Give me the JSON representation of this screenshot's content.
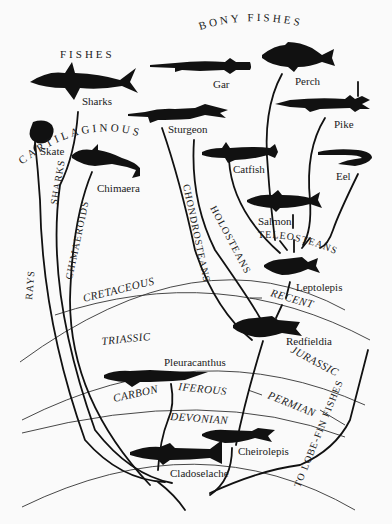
{
  "headings": {
    "cartilaginous": "CARTILAGINOUS",
    "cartilaginous_2": "FISHES",
    "bony": "BONY   FISHES"
  },
  "fishes": {
    "sharks": "Sharks",
    "gar": "Gar",
    "perch": "Perch",
    "pike": "Pike",
    "sturgeon": "Sturgeon",
    "skate": "Skate",
    "chimaera": "Chimaera",
    "catfish": "Catfish",
    "eel": "Eel",
    "salmon": "Salmon",
    "leptolepis": "Leptolepis",
    "redfieldia": "Redfieldia",
    "pleuracanthus": "Pleuracanthus",
    "cheirolepis": "Cheirolepis",
    "cladoselache": "Cladoselache"
  },
  "groups": {
    "rays": "RAYS",
    "sharks": "SHARKS",
    "chimaeroids": "CHIMAEROIDS",
    "chondrosteans": "CHONDROSTEANS",
    "holosteans": "HOLOSTEANS",
    "teleosteans": "TELEOSTEANS",
    "lobe_fin": "TO LOBE-FIN FISHES"
  },
  "periods": {
    "cretaceous": "CRETACEOUS",
    "recent": "RECENT",
    "triassic": "TRIASSIC",
    "jurassic": "JURASSIC",
    "carbon": "CARBON",
    "iferous": "IFEROUS",
    "permian": "PERMIAN",
    "devonian": "DEVONIAN"
  }
}
